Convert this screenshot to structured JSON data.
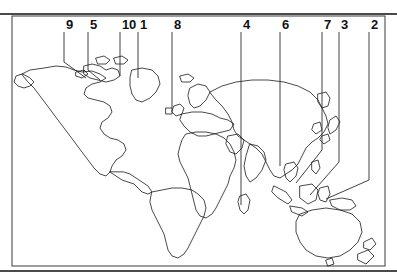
{
  "figure": {
    "width": 397,
    "height": 280,
    "background_color": "#ffffff",
    "line_color": "#1a1a1a",
    "rule_color": "#4a4a4a",
    "label_color": "#121212"
  },
  "rules": {
    "top": {
      "y": 13,
      "thickness": 2
    },
    "bottom": {
      "y": 270,
      "thickness": 2
    }
  },
  "map": {
    "frame": {
      "x": 12,
      "y": 16,
      "width": 373,
      "height": 250
    },
    "projection": "equirectangular",
    "fill": "none",
    "stroke_width": 0.8,
    "regions": [
      "North America",
      "South America",
      "Greenland",
      "Canadian Arctic Archipelago",
      "Europe",
      "Africa",
      "Asia",
      "Southeast Asia",
      "New Guinea",
      "Australia",
      "New Zealand",
      "Japan",
      "Madagascar",
      "British Isles",
      "Iceland"
    ]
  },
  "callouts": [
    {
      "id": "callout-9",
      "label": "9",
      "label_x": 66,
      "label_y": 18,
      "tick_x": 64,
      "path": "M64,32 L64,62 L86,78",
      "target": "Canadian Arctic Archipelago"
    },
    {
      "id": "callout-5",
      "label": "5",
      "label_x": 90,
      "label_y": 18,
      "tick_x": 88,
      "path": "M88,32 L88,70 L100,80",
      "target": "Canadian Arctic Archipelago"
    },
    {
      "id": "callout-10",
      "label": "10",
      "label_x": 122,
      "label_y": 18,
      "tick_x": 120,
      "path": "M120,32 L120,76",
      "target": "Greenland"
    },
    {
      "id": "callout-1",
      "label": "1",
      "label_x": 140,
      "label_y": 18,
      "tick_x": 138,
      "path": "M138,32 L138,78",
      "target": "Greenland"
    },
    {
      "id": "callout-8",
      "label": "8",
      "label_x": 174,
      "label_y": 18,
      "tick_x": 172,
      "path": "M172,32 L172,108",
      "target": "Scandinavia / Northern Europe"
    },
    {
      "id": "callout-4",
      "label": "4",
      "label_x": 243,
      "label_y": 18,
      "tick_x": 241,
      "path": "M241,32 L241,205",
      "target": "Southern Indian Ocean"
    },
    {
      "id": "callout-6",
      "label": "6",
      "label_x": 282,
      "label_y": 18,
      "tick_x": 280,
      "path": "M280,32 L280,166",
      "target": "Southeast Asia"
    },
    {
      "id": "callout-7",
      "label": "7",
      "label_x": 324,
      "label_y": 18,
      "tick_x": 322,
      "path": "M322,32 L322,150 L296,183",
      "target": "Indonesia"
    },
    {
      "id": "callout-3",
      "label": "3",
      "label_x": 341,
      "label_y": 18,
      "tick_x": 339,
      "path": "M339,32 L339,162 L310,195",
      "target": "New Guinea"
    },
    {
      "id": "callout-2",
      "label": "2",
      "label_x": 371,
      "label_y": 18,
      "tick_x": 369,
      "path": "M369,32 L369,180 L326,199",
      "target": "New Guinea / Melanesia"
    }
  ]
}
